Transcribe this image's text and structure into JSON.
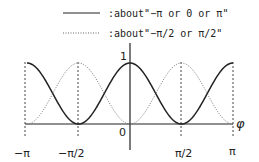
{
  "chart_data": {
    "type": "line",
    "title": "",
    "xlabel": "φ",
    "ylabel": "",
    "xlim": [
      -3.14159,
      3.14159
    ],
    "ylim": [
      0,
      1
    ],
    "x_ticks": [
      "−π",
      "−π/2",
      "0",
      "π/2",
      "π"
    ],
    "y_ticks": [
      "0",
      "1"
    ],
    "grid": false,
    "legend_position": "top",
    "series": [
      {
        "name": ":about\"−π or 0 or  π\"",
        "style": "solid",
        "function": "cos^2(phi)",
        "x": [
          -3.1416,
          -2.3562,
          -1.5708,
          -0.7854,
          0,
          0.7854,
          1.5708,
          2.3562,
          3.1416
        ],
        "values": [
          1,
          0.5,
          0,
          0.5,
          1,
          0.5,
          0,
          0.5,
          1
        ]
      },
      {
        "name": ":about\"−π/2 or  π/2\"",
        "style": "dotted",
        "function": "sin^2(phi)",
        "x": [
          -3.1416,
          -2.3562,
          -1.5708,
          -0.7854,
          0,
          0.7854,
          1.5708,
          2.3562,
          3.1416
        ],
        "values": [
          0,
          0.5,
          1,
          0.5,
          0,
          0.5,
          1,
          0.5,
          0
        ]
      }
    ],
    "annotations": [
      "dashed vertical guides at −π, −π/2, π/2, π"
    ]
  },
  "legend": {
    "solid_label": ":about\"−π or 0 or  π\"",
    "dotted_label": ":about\"−π/2 or  π/2\""
  },
  "axes": {
    "x_label": "φ",
    "y_max_label": "1",
    "origin_label": "0",
    "ticks": {
      "neg_pi": "−π",
      "neg_half_pi": "−π/2",
      "half_pi": "π/2",
      "pi": "π"
    }
  }
}
